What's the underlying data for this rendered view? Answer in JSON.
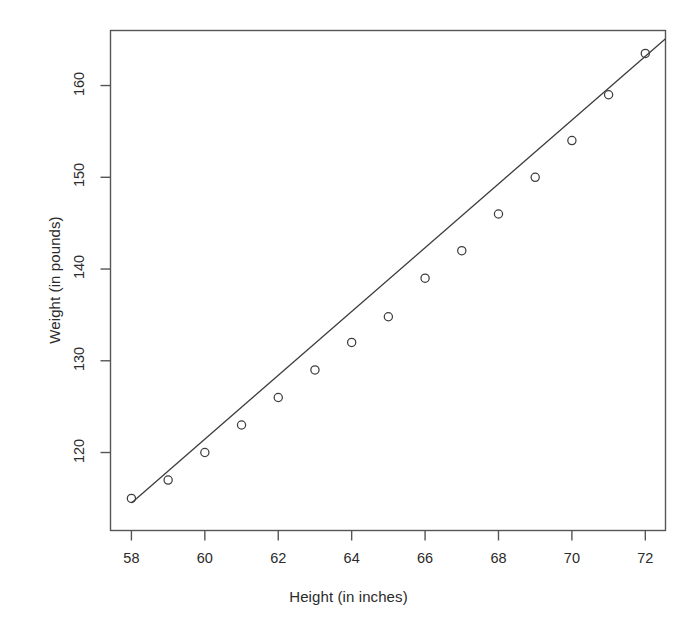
{
  "chart_data": {
    "type": "scatter",
    "title": "",
    "subtitle": "",
    "xlabel": "Height (in inches)",
    "ylabel": "Weight (in pounds)",
    "x": [
      58,
      59,
      60,
      61,
      62,
      63,
      64,
      65,
      66,
      67,
      68,
      69,
      70,
      71,
      72
    ],
    "y": [
      115,
      117,
      120,
      123,
      126,
      129,
      132,
      134.8,
      139,
      142,
      146,
      150,
      154,
      159,
      163.5
    ],
    "series": [
      {
        "name": "observations",
        "marker": "open-circle",
        "values": [
          115,
          117,
          120,
          123,
          126,
          129,
          132,
          134.8,
          139,
          142,
          146,
          150,
          154,
          159,
          163.5
        ]
      }
    ],
    "trendline": {
      "type": "linear-fit",
      "x_start": 58,
      "y_start": 114.5,
      "x_end": 72.55,
      "y_end": 165.1
    },
    "xlim": [
      57.43,
      72.55
    ],
    "ylim": [
      111.5,
      166
    ],
    "xticks": [
      58,
      60,
      62,
      64,
      66,
      68,
      70,
      72
    ],
    "xtick_labels": [
      "58",
      "60",
      "62",
      "64",
      "66",
      "68",
      "70",
      "72"
    ],
    "yticks": [
      120,
      130,
      140,
      150,
      160
    ],
    "ytick_labels": [
      "120",
      "130",
      "140",
      "150",
      "160"
    ],
    "grid": false,
    "legend": "none",
    "box_frame": true,
    "colors": {
      "axis": "#555555",
      "marker": "#3d3d3d",
      "line": "#3d3d3d",
      "background": "#ffffff",
      "text": "#2b2b2b"
    }
  }
}
